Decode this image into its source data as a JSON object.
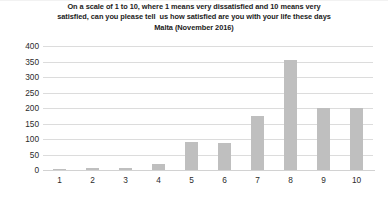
{
  "chart_data": {
    "type": "bar",
    "title": "On a scale of 1 to 10, where 1 means very dissatisfied and 10 means very satisfied, can you please tell  us how satisfied are you with your life these days Malta (November 2016)",
    "title_lines": [
      "On a scale of 1 to 10, where 1 means very dissatisfied and 10 means very",
      "satisfied, can you please tell  us how satisfied are you with your life these days",
      "Malta (November 2016)"
    ],
    "categories": [
      "1",
      "2",
      "3",
      "4",
      "5",
      "6",
      "7",
      "8",
      "9",
      "10"
    ],
    "values": [
      4,
      7,
      5,
      18,
      90,
      88,
      175,
      355,
      200,
      200
    ],
    "series": [
      {
        "name": "Responses",
        "values": [
          4,
          7,
          5,
          18,
          90,
          88,
          175,
          355,
          200,
          200
        ]
      }
    ],
    "xlabel": "",
    "ylabel": "",
    "ylim": [
      0,
      400
    ],
    "ytick_labels": [
      "400",
      "350",
      "300",
      "250",
      "200",
      "150",
      "100",
      "50",
      "0"
    ],
    "ytick_values": [
      400,
      350,
      300,
      250,
      200,
      150,
      100,
      50,
      0
    ],
    "ytick_step": 50,
    "grid": true,
    "legend": false,
    "legend_position": "none",
    "bar_color": "#bfbfbf",
    "gridline_color": "#dcdcdc",
    "background_color": "#ffffff",
    "title_color": "#1b1b1b",
    "tick_label_color": "#2b2b2b"
  }
}
